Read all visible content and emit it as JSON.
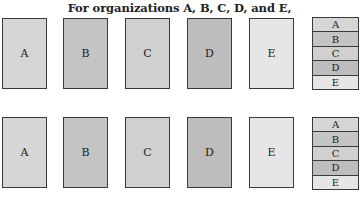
{
  "title": "For organizations A, B, C, D, and E,",
  "colors": {
    "A": "#d6d6d6",
    "B": "#c4c4c4",
    "C": "#d0d0d0",
    "D": "#bdbdbd",
    "E": "#e6e6e6",
    "border": "#3a3a3a"
  },
  "rows": [
    {
      "cards": [
        "A",
        "B",
        "C",
        "D",
        "E"
      ],
      "stack": [
        "A",
        "B",
        "C",
        "D",
        "E"
      ]
    },
    {
      "cards": [
        "A",
        "B",
        "C",
        "D",
        "E"
      ],
      "stack": [
        "A",
        "B",
        "C",
        "D",
        "E"
      ]
    }
  ]
}
